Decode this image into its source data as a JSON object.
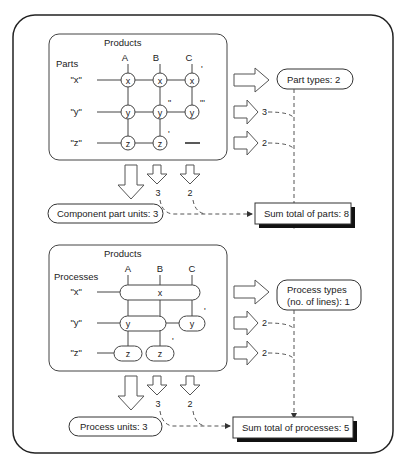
{
  "top": {
    "products_label": "Products",
    "rows_label": "Parts",
    "columns": [
      "A",
      "B",
      "C"
    ],
    "rows": [
      "\"x\"",
      "\"y\"",
      "\"z\""
    ],
    "nodes": {
      "ax": "x",
      "bx": "x",
      "cx": "x",
      "ay": "y",
      "by": "y",
      "cy": "y",
      "az": "z",
      "bz": "z"
    },
    "primes": {
      "cx": "'",
      "by": "\"",
      "cy": "\"'",
      "bz": "'"
    },
    "row_counts": [
      "3",
      "2"
    ],
    "col_counts": [
      "3",
      "2"
    ],
    "types_label": "Part types:  2",
    "units_label": "Component part units:  3",
    "sum_label": "Sum total of parts:  8"
  },
  "bottom": {
    "products_label": "Products",
    "rows_label": "Processes",
    "columns": [
      "A",
      "B",
      "C"
    ],
    "rows": [
      "\"x\"",
      "\"y\"",
      "\"z\""
    ],
    "nodes": {
      "x_all": "x",
      "y_ab": "y",
      "y_c": "y",
      "z_a": "z",
      "z_b": "z"
    },
    "primes": {
      "y_c": "'",
      "z_b": "'"
    },
    "row_counts": [
      "2",
      "2"
    ],
    "col_counts": [
      "3",
      "2"
    ],
    "types_label_line1": "Process types",
    "types_label_line2": "(no. of lines):  1",
    "units_label": "Process units:  3",
    "sum_label": "Sum total of processes:  5"
  }
}
